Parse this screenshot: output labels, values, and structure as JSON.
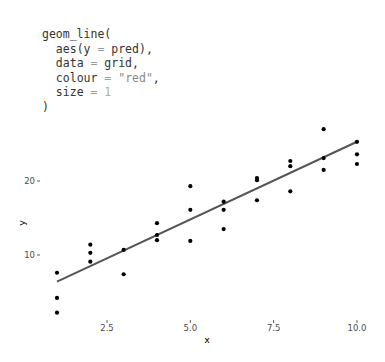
{
  "code": {
    "lines": [
      {
        "indent": "",
        "parts": [
          {
            "t": "geom_line(",
            "k": "fn"
          }
        ]
      },
      {
        "indent": "  ",
        "parts": [
          {
            "t": "aes(y ",
            "k": "fn"
          },
          {
            "t": "=",
            "k": "op"
          },
          {
            "t": " pred),",
            "k": "fn"
          }
        ]
      },
      {
        "indent": "  ",
        "parts": [
          {
            "t": "data ",
            "k": "fn"
          },
          {
            "t": "=",
            "k": "op"
          },
          {
            "t": " grid,",
            "k": "fn"
          }
        ]
      },
      {
        "indent": "  ",
        "parts": [
          {
            "t": "colour ",
            "k": "fn"
          },
          {
            "t": "=",
            "k": "op"
          },
          {
            "t": " ",
            "k": "fn"
          },
          {
            "t": "\"red\"",
            "k": "str"
          },
          {
            "t": ",",
            "k": "fn"
          }
        ]
      },
      {
        "indent": "  ",
        "parts": [
          {
            "t": "size ",
            "k": "fn"
          },
          {
            "t": "=",
            "k": "op"
          },
          {
            "t": " ",
            "k": "fn"
          },
          {
            "t": "1",
            "k": "num"
          }
        ]
      },
      {
        "indent": "",
        "parts": [
          {
            "t": ")",
            "k": "fn"
          }
        ]
      }
    ]
  },
  "colors": {
    "points": "#000000",
    "line": "#555555",
    "tick_text": "#4d4d4d",
    "background": "#ffffff"
  },
  "chart_data": {
    "type": "scatter",
    "title": "",
    "xlabel": "x",
    "ylabel": "y",
    "xlim": [
      0.55,
      10.45
    ],
    "ylim": [
      1.0,
      28.5
    ],
    "x_ticks": [
      2.5,
      5.0,
      7.5,
      10.0
    ],
    "x_tick_labels": [
      "2.5",
      "5.0",
      "7.5",
      "10.0"
    ],
    "y_ticks": [
      10,
      20
    ],
    "y_tick_labels": [
      "10",
      "20"
    ],
    "grid": false,
    "legend": null,
    "series": [
      {
        "name": "observed",
        "kind": "points",
        "x": [
          1,
          1,
          1,
          2,
          2,
          2,
          3,
          3,
          4,
          4,
          4,
          5,
          5,
          5,
          6,
          6,
          6,
          7,
          7,
          7,
          8,
          8,
          8,
          9,
          9,
          9,
          10,
          10,
          10
        ],
        "y": [
          7.6,
          4.2,
          2.2,
          11.4,
          10.3,
          9.1,
          10.7,
          7.4,
          14.3,
          12.7,
          12.0,
          19.3,
          16.1,
          11.9,
          17.2,
          16.1,
          13.5,
          20.4,
          20.1,
          17.4,
          22.7,
          22.0,
          18.6,
          27.0,
          23.1,
          21.5,
          25.3,
          23.6,
          22.3
        ]
      },
      {
        "name": "pred",
        "kind": "line",
        "x": [
          1,
          10
        ],
        "y": [
          6.4,
          25.3
        ]
      }
    ]
  }
}
